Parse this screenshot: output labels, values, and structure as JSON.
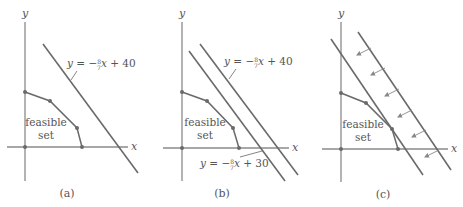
{
  "panels": [
    {
      "id": "a",
      "caption": "(a)",
      "axis_labels": {
        "x": "x",
        "y": "y"
      },
      "region_label": [
        "feasible",
        "set"
      ],
      "lines": [
        {
          "equation": "y = −8/7 x + 40",
          "y_prefix": "y",
          "equals": " = −",
          "num": "8",
          "den": "7",
          "x_var": "x",
          "suffix": " + 40"
        }
      ]
    },
    {
      "id": "b",
      "caption": "(b)",
      "axis_labels": {
        "x": "x",
        "y": "y"
      },
      "region_label": [
        "feasible",
        "set"
      ],
      "lines": [
        {
          "equation": "y = −8/7 x + 40",
          "y_prefix": "y",
          "equals": " = −",
          "num": "8",
          "den": "7",
          "x_var": "x",
          "suffix": " + 40"
        },
        {
          "equation": "y = −8/7 x + 30",
          "y_prefix": "y",
          "equals": " = −",
          "num": "8",
          "den": "7",
          "x_var": "x",
          "suffix": " + 30"
        }
      ]
    },
    {
      "id": "c",
      "caption": "(c)",
      "axis_labels": {
        "x": "x",
        "y": "y"
      },
      "region_label": [
        "feasible",
        "set"
      ],
      "arrows_count": 6,
      "lines": []
    }
  ],
  "colors": {
    "axis": "#8a8a8a",
    "line": "#6a6a6a",
    "text": "#555555"
  }
}
